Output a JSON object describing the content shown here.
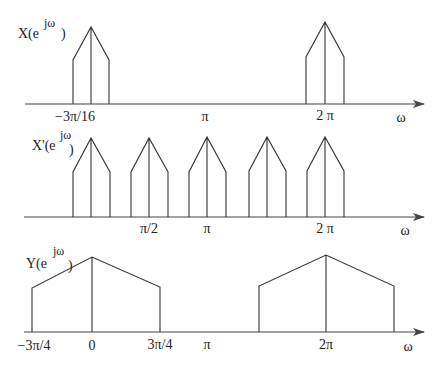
{
  "diagram": {
    "stroke_color": "#333333",
    "background": "#ffffff",
    "panels": [
      {
        "id": "X",
        "label_main": "X(e",
        "label_sup": "jω",
        "label_close": ")",
        "axis_label": "ω",
        "ticks": [
          {
            "text": "−3π/16",
            "x": 75
          },
          {
            "text": "π",
            "x": 205
          },
          {
            "text": "2 π",
            "x": 325
          }
        ]
      },
      {
        "id": "Xprime",
        "label_main": "X'(e",
        "label_sup": "jω",
        "label_close": ")",
        "axis_label": "ω",
        "ticks": [
          {
            "text": "π/2",
            "x": 149
          },
          {
            "text": "π",
            "x": 207
          },
          {
            "text": "2 π",
            "x": 325
          }
        ]
      },
      {
        "id": "Y",
        "label_main": "Y(e",
        "label_sup": "jω",
        "label_close": ")",
        "axis_label": "ω",
        "ticks": [
          {
            "text": "−3π/4",
            "x": 33
          },
          {
            "text": "0",
            "x": 92
          },
          {
            "text": "3π/4",
            "x": 160
          },
          {
            "text": "π",
            "x": 207
          },
          {
            "text": "2π",
            "x": 326
          }
        ]
      }
    ]
  }
}
